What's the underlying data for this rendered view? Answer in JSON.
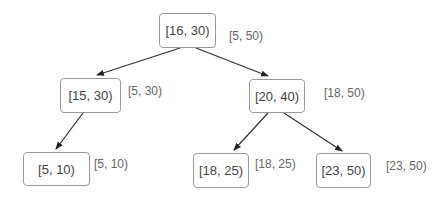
{
  "tree": {
    "nodes": [
      {
        "id": "root",
        "interval": "[16, 30)",
        "max": "[5, 50)"
      },
      {
        "id": "l",
        "interval": "[15, 30)",
        "max": "[5, 30)"
      },
      {
        "id": "r",
        "interval": "[20, 40)",
        "max": "[18, 50)"
      },
      {
        "id": "ll",
        "interval": "[5, 10)",
        "max": "[5, 10)"
      },
      {
        "id": "rl",
        "interval": "[18, 25)",
        "max": "[18, 25)"
      },
      {
        "id": "rr",
        "interval": "[23, 50)",
        "max": "[23, 50)"
      }
    ],
    "edges": [
      [
        "root",
        "l"
      ],
      [
        "root",
        "r"
      ],
      [
        "l",
        "ll"
      ],
      [
        "r",
        "rl"
      ],
      [
        "r",
        "rr"
      ]
    ]
  }
}
